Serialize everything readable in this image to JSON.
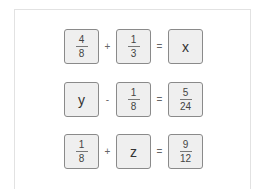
{
  "equations": [
    {
      "left": {
        "type": "fraction",
        "numerator": "4",
        "denominator": "8"
      },
      "operator": "+",
      "right": {
        "type": "fraction",
        "numerator": "1",
        "denominator": "3"
      },
      "equals": "=",
      "result": {
        "type": "variable",
        "value": "x"
      }
    },
    {
      "left": {
        "type": "variable",
        "value": "y"
      },
      "operator": "-",
      "right": {
        "type": "fraction",
        "numerator": "1",
        "denominator": "8"
      },
      "equals": "=",
      "result": {
        "type": "fraction",
        "numerator": "5",
        "denominator": "24"
      }
    },
    {
      "left": {
        "type": "fraction",
        "numerator": "1",
        "denominator": "8"
      },
      "operator": "+",
      "right": {
        "type": "variable",
        "value": "z"
      },
      "equals": "=",
      "result": {
        "type": "fraction",
        "numerator": "9",
        "denominator": "12"
      }
    }
  ],
  "colors": {
    "box_fill": "#efefef",
    "box_border": "#8a8a8a",
    "frame_border": "#e2e2e2"
  }
}
